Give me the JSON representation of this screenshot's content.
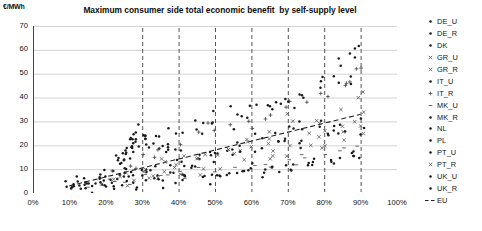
{
  "chart_data": {
    "type": "scatter",
    "title": "Maximum consumer side total economic benefit  by self-supply level",
    "xlabel": "",
    "ylabel": "€/MWh",
    "yunit": "€/MWh",
    "xlim": [
      0,
      100
    ],
    "ylim": [
      0,
      70
    ],
    "xticks": [
      "0%",
      "10%",
      "20%",
      "30%",
      "40%",
      "50%",
      "60%",
      "70%",
      "80%",
      "90%",
      "100%"
    ],
    "xtick_values": [
      0,
      10,
      20,
      30,
      40,
      50,
      60,
      70,
      80,
      90,
      100
    ],
    "yticks": [
      "0",
      "10",
      "20",
      "30",
      "40",
      "50",
      "60",
      "70"
    ],
    "ytick_values": [
      0,
      10,
      20,
      30,
      40,
      50,
      60,
      70
    ],
    "grid": "horizontal",
    "legend_position": "right",
    "legend": [
      {
        "label": "DE_U",
        "marker": "dot"
      },
      {
        "label": "DE_R",
        "marker": "dot"
      },
      {
        "label": "DK",
        "marker": "dot"
      },
      {
        "label": "GR_U",
        "marker": "cross"
      },
      {
        "label": "GR_R",
        "marker": "cross"
      },
      {
        "label": "IT_U",
        "marker": "dot"
      },
      {
        "label": "IT_R",
        "marker": "plus"
      },
      {
        "label": "MK_U",
        "marker": "dash"
      },
      {
        "label": "MK_R",
        "marker": "dot"
      },
      {
        "label": "NL",
        "marker": "dot"
      },
      {
        "label": "PL",
        "marker": "dot"
      },
      {
        "label": "PT_U",
        "marker": "dot"
      },
      {
        "label": "PT_R",
        "marker": "cross"
      },
      {
        "label": "UK_U",
        "marker": "dot"
      },
      {
        "label": "UK_R",
        "marker": "dot"
      },
      {
        "label": "EU",
        "marker": "dashed-line"
      }
    ],
    "trendline": {
      "name": "EU",
      "style": "dashed",
      "x": [
        10,
        90
      ],
      "y": [
        3,
        33
      ]
    },
    "vertical_markers": [
      30,
      40,
      50,
      60,
      70,
      80,
      90
    ],
    "series": [
      {
        "name": "DE_U",
        "marker": "dot",
        "points": [
          [
            10,
            3.0
          ],
          [
            12,
            3.6
          ],
          [
            14,
            4.4
          ],
          [
            16,
            5.2
          ],
          [
            18,
            6.5
          ],
          [
            20,
            8.0
          ],
          [
            22,
            10.0
          ],
          [
            23,
            12.0
          ],
          [
            24,
            14.5
          ],
          [
            25,
            17.0
          ],
          [
            26,
            19.5
          ],
          [
            27,
            22.0
          ],
          [
            28,
            24.5
          ],
          [
            29,
            26.0
          ],
          [
            30,
            27.5
          ],
          [
            31,
            25.0
          ],
          [
            32,
            23.0
          ],
          [
            34,
            21.0
          ],
          [
            36,
            19.0
          ],
          [
            38,
            18.0
          ]
        ]
      },
      {
        "name": "DE_R",
        "marker": "dot",
        "points": [
          [
            10,
            2.5
          ],
          [
            13,
            3.2
          ],
          [
            16,
            4.2
          ],
          [
            19,
            5.6
          ],
          [
            21,
            7.2
          ],
          [
            23,
            9.0
          ],
          [
            24,
            11.0
          ],
          [
            25,
            13.5
          ],
          [
            26,
            16.0
          ],
          [
            27,
            18.0
          ],
          [
            28,
            20.0
          ],
          [
            29,
            22.0
          ],
          [
            30,
            20.0
          ],
          [
            32,
            18.5
          ],
          [
            35,
            17.5
          ],
          [
            38,
            16.5
          ],
          [
            40,
            16.0
          ]
        ]
      },
      {
        "name": "DK",
        "marker": "dot",
        "points": [
          [
            12,
            2.8
          ],
          [
            15,
            3.5
          ],
          [
            18,
            4.0
          ],
          [
            22,
            5.0
          ],
          [
            26,
            6.5
          ],
          [
            30,
            8.5
          ],
          [
            34,
            10.5
          ],
          [
            38,
            12.0
          ],
          [
            42,
            13.5
          ],
          [
            46,
            15.0
          ],
          [
            50,
            16.5
          ],
          [
            54,
            18.0
          ],
          [
            58,
            20.0
          ],
          [
            62,
            22.0
          ],
          [
            66,
            24.0
          ],
          [
            70,
            26.5
          ],
          [
            74,
            28.0
          ],
          [
            78,
            30.0
          ]
        ]
      },
      {
        "name": "GR_U",
        "marker": "cross",
        "points": [
          [
            20,
            5.0
          ],
          [
            25,
            7.0
          ],
          [
            30,
            8.5
          ],
          [
            35,
            10.0
          ],
          [
            40,
            12.0
          ],
          [
            45,
            13.0
          ],
          [
            50,
            14.5
          ],
          [
            55,
            16.0
          ],
          [
            60,
            17.5
          ],
          [
            65,
            19.0
          ],
          [
            70,
            21.0
          ],
          [
            75,
            23.5
          ],
          [
            80,
            25.0
          ],
          [
            85,
            27.0
          ],
          [
            88,
            30.0
          ],
          [
            90,
            33.0
          ]
        ]
      },
      {
        "name": "GR_R",
        "marker": "cross",
        "points": [
          [
            22,
            4.2
          ],
          [
            28,
            6.0
          ],
          [
            34,
            7.5
          ],
          [
            40,
            9.0
          ],
          [
            46,
            10.5
          ],
          [
            52,
            12.0
          ],
          [
            58,
            13.5
          ],
          [
            64,
            15.0
          ],
          [
            70,
            17.0
          ],
          [
            76,
            19.0
          ],
          [
            80,
            21.0
          ],
          [
            85,
            23.0
          ],
          [
            90,
            26.0
          ]
        ]
      },
      {
        "name": "IT_U",
        "marker": "dot",
        "points": [
          [
            24,
            10.0
          ],
          [
            26,
            14.0
          ],
          [
            28,
            18.0
          ],
          [
            30,
            22.0
          ],
          [
            35,
            24.0
          ],
          [
            40,
            26.0
          ],
          [
            45,
            30.0
          ],
          [
            50,
            33.0
          ],
          [
            55,
            35.0
          ],
          [
            58,
            31.0
          ],
          [
            60,
            36.0
          ],
          [
            65,
            38.0
          ],
          [
            70,
            40.0
          ],
          [
            72,
            36.0
          ],
          [
            75,
            42.0
          ],
          [
            78,
            45.0
          ],
          [
            80,
            47.0
          ],
          [
            82,
            50.0
          ],
          [
            85,
            52.0
          ],
          [
            88,
            55.0
          ],
          [
            90,
            62.0
          ]
        ]
      },
      {
        "name": "IT_R",
        "marker": "plus",
        "points": [
          [
            22,
            8.0
          ],
          [
            26,
            12.0
          ],
          [
            30,
            16.0
          ],
          [
            35,
            19.0
          ],
          [
            40,
            21.0
          ],
          [
            45,
            24.0
          ],
          [
            50,
            27.0
          ],
          [
            55,
            29.0
          ],
          [
            60,
            31.0
          ],
          [
            65,
            33.0
          ],
          [
            70,
            35.0
          ],
          [
            75,
            38.0
          ],
          [
            80,
            41.0
          ],
          [
            85,
            45.0
          ],
          [
            88,
            48.0
          ],
          [
            90,
            52.0
          ]
        ]
      },
      {
        "name": "MK_U",
        "marker": "dash",
        "points": [
          [
            15,
            3.0
          ],
          [
            20,
            4.0
          ],
          [
            25,
            5.5
          ],
          [
            30,
            6.5
          ],
          [
            35,
            7.5
          ],
          [
            40,
            8.5
          ],
          [
            45,
            9.5
          ],
          [
            50,
            10.5
          ],
          [
            55,
            11.5
          ],
          [
            60,
            12.5
          ],
          [
            65,
            13.5
          ],
          [
            70,
            14.5
          ],
          [
            75,
            15.5
          ],
          [
            80,
            16.5
          ],
          [
            85,
            18.0
          ],
          [
            90,
            20.0
          ]
        ]
      },
      {
        "name": "MK_R",
        "marker": "dot",
        "points": [
          [
            18,
            2.5
          ],
          [
            24,
            3.5
          ],
          [
            30,
            4.5
          ],
          [
            36,
            5.5
          ],
          [
            42,
            6.0
          ],
          [
            48,
            7.0
          ],
          [
            54,
            8.0
          ],
          [
            60,
            9.0
          ],
          [
            66,
            10.0
          ],
          [
            72,
            11.0
          ],
          [
            78,
            12.0
          ],
          [
            84,
            13.5
          ],
          [
            90,
            15.0
          ]
        ]
      },
      {
        "name": "NL",
        "marker": "dot",
        "points": [
          [
            14,
            3.0
          ],
          [
            20,
            4.5
          ],
          [
            26,
            6.0
          ],
          [
            32,
            8.0
          ],
          [
            38,
            10.0
          ],
          [
            44,
            12.0
          ],
          [
            50,
            14.0
          ],
          [
            56,
            16.0
          ],
          [
            62,
            18.0
          ],
          [
            68,
            20.0
          ],
          [
            74,
            23.0
          ],
          [
            80,
            26.0
          ],
          [
            85,
            28.0
          ],
          [
            90,
            31.0
          ]
        ]
      },
      {
        "name": "PL",
        "marker": "dot",
        "points": [
          [
            16,
            2.0
          ],
          [
            22,
            3.0
          ],
          [
            28,
            4.0
          ],
          [
            34,
            5.0
          ],
          [
            40,
            6.0
          ],
          [
            46,
            7.0
          ],
          [
            52,
            8.0
          ],
          [
            58,
            9.0
          ],
          [
            64,
            10.0
          ],
          [
            70,
            11.0
          ],
          [
            76,
            12.5
          ],
          [
            82,
            14.0
          ],
          [
            88,
            16.0
          ]
        ]
      },
      {
        "name": "PT_U",
        "marker": "dot",
        "points": [
          [
            25,
            12.0
          ],
          [
            30,
            18.0
          ],
          [
            35,
            22.0
          ],
          [
            40,
            25.0
          ],
          [
            45,
            28.0
          ],
          [
            50,
            30.0
          ],
          [
            55,
            28.0
          ],
          [
            60,
            33.0
          ],
          [
            65,
            35.0
          ],
          [
            70,
            38.0
          ],
          [
            75,
            40.0
          ],
          [
            80,
            44.0
          ],
          [
            85,
            48.0
          ],
          [
            88,
            50.0
          ]
        ]
      },
      {
        "name": "PT_R",
        "marker": "cross",
        "points": [
          [
            24,
            6.0
          ],
          [
            30,
            9.0
          ],
          [
            36,
            12.0
          ],
          [
            42,
            15.0
          ],
          [
            48,
            18.0
          ],
          [
            54,
            20.0
          ],
          [
            60,
            23.0
          ],
          [
            66,
            26.0
          ],
          [
            72,
            29.0
          ],
          [
            78,
            32.0
          ],
          [
            84,
            36.0
          ],
          [
            90,
            40.0
          ]
        ]
      },
      {
        "name": "UK_U",
        "marker": "dot",
        "points": [
          [
            20,
            4.0
          ],
          [
            26,
            6.0
          ],
          [
            32,
            8.0
          ],
          [
            38,
            10.0
          ],
          [
            44,
            12.0
          ],
          [
            50,
            14.0
          ],
          [
            56,
            16.0
          ],
          [
            62,
            18.0
          ],
          [
            68,
            20.0
          ],
          [
            74,
            22.0
          ],
          [
            80,
            24.0
          ],
          [
            86,
            26.0
          ],
          [
            90,
            28.0
          ]
        ]
      },
      {
        "name": "UK_R",
        "marker": "dot",
        "points": [
          [
            22,
            2.5
          ],
          [
            28,
            3.5
          ],
          [
            34,
            4.5
          ],
          [
            40,
            5.5
          ],
          [
            46,
            6.5
          ],
          [
            52,
            7.5
          ],
          [
            58,
            8.5
          ],
          [
            64,
            9.5
          ],
          [
            70,
            11.0
          ],
          [
            76,
            12.0
          ],
          [
            82,
            13.5
          ],
          [
            88,
            15.0
          ]
        ]
      }
    ]
  }
}
